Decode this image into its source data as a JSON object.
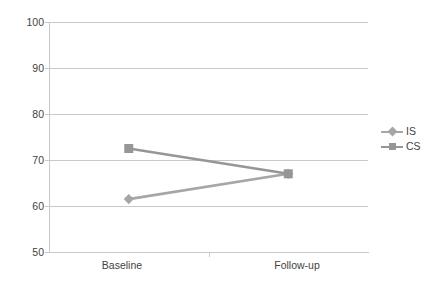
{
  "chart_data": {
    "type": "line",
    "title": "",
    "xlabel": "",
    "ylabel": "",
    "categories": [
      "Baseline",
      "Follow-up"
    ],
    "series": [
      {
        "name": "IS",
        "values": [
          61.5,
          67.0
        ],
        "color": "#a6a6a6",
        "marker": "diamond"
      },
      {
        "name": "CS",
        "values": [
          72.5,
          67.0
        ],
        "color": "#969696",
        "marker": "square"
      }
    ],
    "ylim": [
      50,
      100
    ],
    "yticks": [
      50,
      60,
      70,
      80,
      90,
      100
    ],
    "ytick_labels": [
      "50",
      "60",
      "70",
      "80",
      "90",
      "100"
    ],
    "grid": true,
    "grid_axis": "y",
    "legend_position": "right"
  },
  "axes": {
    "y_labels": [
      "100",
      "90",
      "80",
      "70",
      "60",
      "50"
    ],
    "x_labels": [
      "Baseline",
      "Follow-up"
    ]
  },
  "legend": {
    "entries": [
      {
        "label": "IS"
      },
      {
        "label": "CS"
      }
    ]
  },
  "style": {
    "grid_color": "#c9c9c9",
    "axis_color": "#c9c9c9",
    "text_color": "#3f3f3f",
    "background": "#ffffff",
    "series_is_color": "#a6a6a6",
    "series_cs_color": "#969696"
  }
}
